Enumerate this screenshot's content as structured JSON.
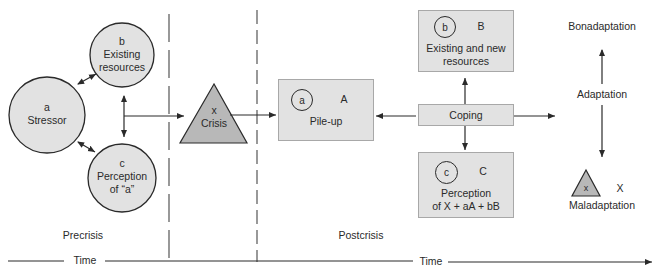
{
  "diagram": {
    "colors": {
      "fill": "#e2e2e2",
      "stroke": "#2a2a2a",
      "box_border": "#a8a8a8",
      "crisis_fill": "#b8b8b8"
    },
    "precrisis": {
      "stressor": {
        "letter": "a",
        "label": "Stressor"
      },
      "resources": {
        "letter": "b",
        "label_line1": "Existing",
        "label_line2": "resources"
      },
      "perception": {
        "letter": "c",
        "label_line1": "Perception",
        "label_line2": "of “a”"
      },
      "crisis": {
        "letter": "x",
        "label": "Crisis"
      }
    },
    "postcrisis": {
      "pileup": {
        "ring": "a",
        "letter": "A",
        "label": "Pile-up"
      },
      "resources": {
        "ring": "b",
        "letter": "B",
        "label_line1": "Existing and new",
        "label_line2": "resources"
      },
      "coping": {
        "label": "Coping"
      },
      "perception": {
        "ring": "c",
        "letter": "C",
        "label_line1": "Perception",
        "label_line2": "of X + aA + bB"
      },
      "adaptation": {
        "top": "Bonadaptation",
        "middle": "Adaptation",
        "bottom": "Maladaptation",
        "triangle_letter": "x",
        "letter": "X"
      }
    },
    "phases": {
      "pre": "Precrisis",
      "post": "Postcrisis"
    },
    "timeline": {
      "left_label": "Time",
      "right_label": "Time"
    }
  }
}
